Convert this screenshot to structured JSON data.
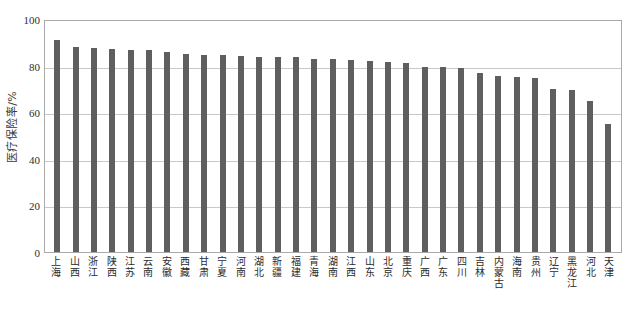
{
  "chart_data": {
    "type": "bar",
    "title": "",
    "subtitle": "",
    "xlabel": "",
    "ylabel": "医疗保险率/%",
    "ylim": [
      0,
      100
    ],
    "yticks": [
      0,
      20,
      40,
      60,
      80,
      100
    ],
    "ytick_labels": [
      "0",
      "20",
      "40",
      "60",
      "80",
      "100"
    ],
    "grid": true,
    "legend": false,
    "legend_position": "none",
    "bar_color": "#5f5f5f",
    "categories": [
      "上海",
      "山西",
      "浙江",
      "陕西",
      "江苏",
      "云南",
      "安徽",
      "西藏",
      "甘肃",
      "宁夏",
      "河南",
      "湖北",
      "新疆",
      "福建",
      "青海",
      "湖南",
      "江西",
      "山东",
      "北京",
      "重庆",
      "广西",
      "广东",
      "四川",
      "吉林",
      "内蒙古",
      "海南",
      "贵州",
      "辽宁",
      "黑龙江",
      "河北",
      "天津"
    ],
    "values": [
      91.0,
      88.0,
      87.5,
      87.0,
      86.5,
      86.5,
      86.0,
      85.0,
      84.5,
      84.5,
      84.0,
      83.5,
      83.5,
      83.5,
      83.0,
      83.0,
      82.5,
      82.0,
      81.5,
      81.0,
      79.5,
      79.5,
      79.0,
      77.0,
      75.5,
      75.0,
      74.5,
      70.0,
      69.5,
      65.0,
      55.0
    ]
  },
  "axis": {
    "y_title": "医疗保险率/%"
  }
}
